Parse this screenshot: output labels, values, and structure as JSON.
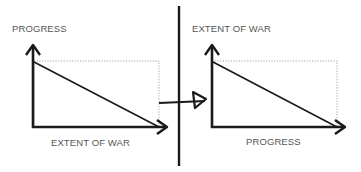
{
  "diagram": {
    "left_panel": {
      "y_axis_label": "PROGRESS",
      "x_axis_label": "EXTENT OF WAR",
      "relationship": "inverse (line descends from top of y-axis to end of x-axis)"
    },
    "right_panel": {
      "y_axis_label": "EXTENT OF WAR",
      "x_axis_label": "PROGRESS",
      "relationship": "inverse (line descends from top of y-axis to end of x-axis)"
    },
    "divider": "vertical-line",
    "transition_arrow": "right-arrow crossing divider"
  },
  "colors": {
    "line": "#1a1a1a",
    "dotted_box": "#888888",
    "label": "#555555",
    "background": "#ffffff"
  }
}
